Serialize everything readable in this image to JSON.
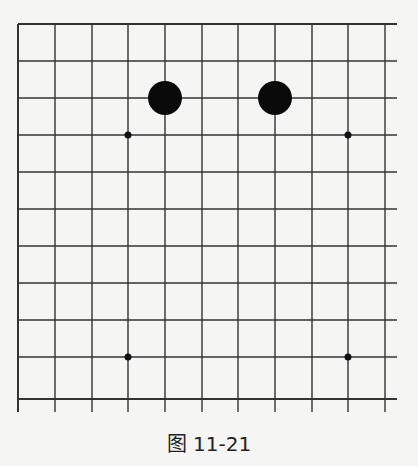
{
  "figure": {
    "caption": "图 11-21",
    "colors": {
      "background": "#f5f5f3",
      "line": "#333333",
      "stone_black": "#0a0a0a"
    }
  },
  "board": {
    "visible_columns": 11,
    "visible_rows": 11,
    "grid_x": [
      18,
      55,
      92,
      128,
      165,
      202,
      238,
      275,
      312,
      348,
      385
    ],
    "grid_y": [
      24,
      61,
      98,
      135,
      172,
      209,
      246,
      283,
      320,
      357,
      399
    ],
    "star_points": [
      {
        "col": 3,
        "row": 3
      },
      {
        "col": 9,
        "row": 3
      },
      {
        "col": 3,
        "row": 9
      },
      {
        "col": 9,
        "row": 9
      }
    ],
    "stones": [
      {
        "color": "black",
        "col": 4,
        "row": 2
      },
      {
        "color": "black",
        "col": 7,
        "row": 2
      }
    ]
  }
}
